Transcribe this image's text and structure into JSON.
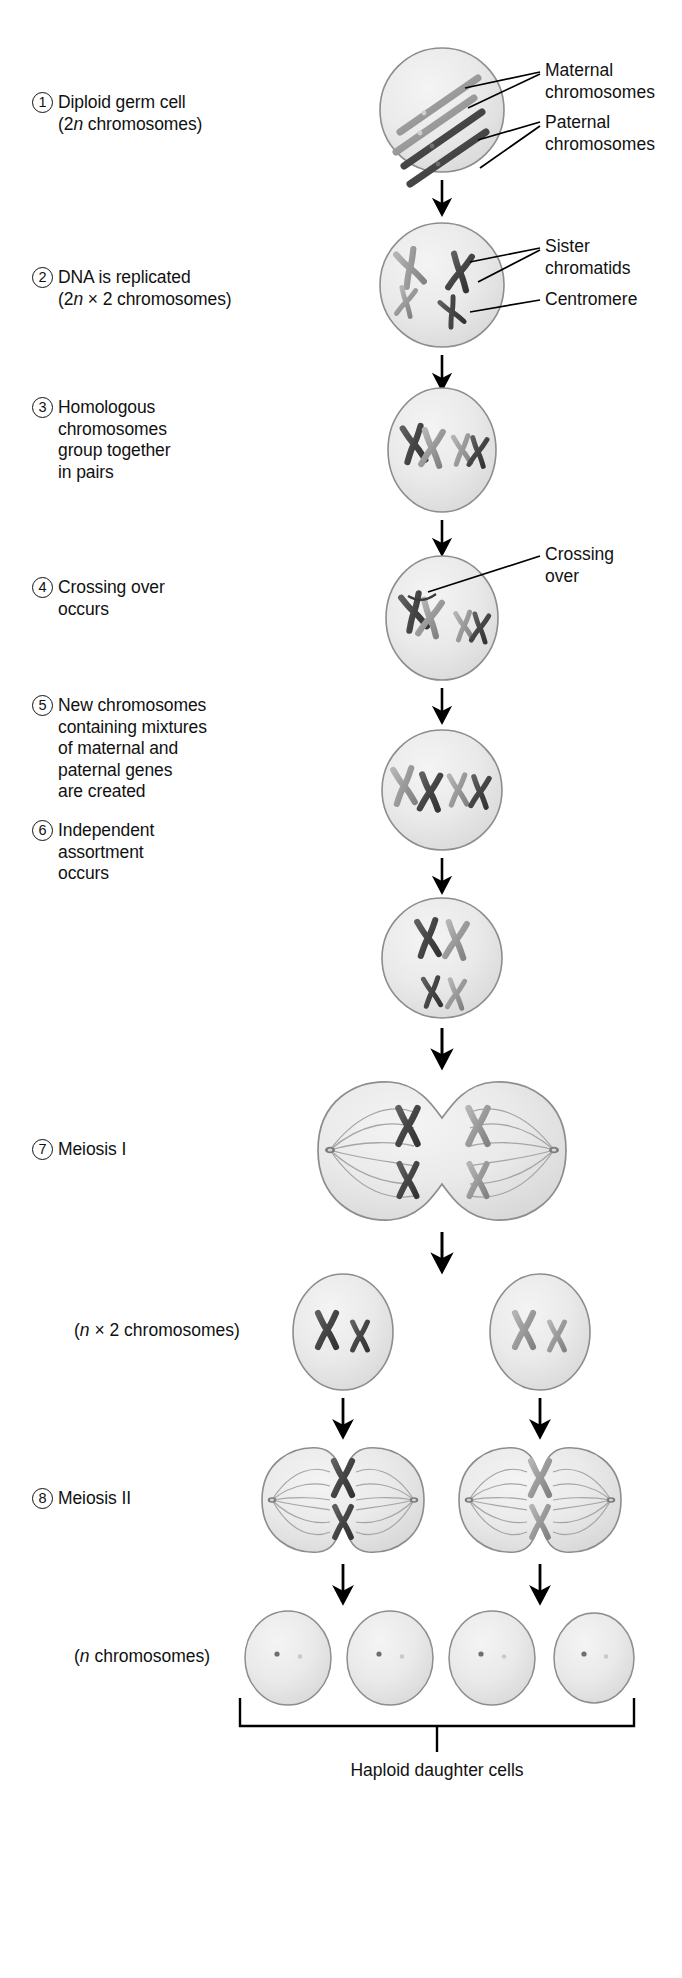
{
  "diagram": {
    "title": "Meiosis",
    "colors": {
      "background": "#ffffff",
      "text": "#111111",
      "cell_fill": "#e8e8e8",
      "cell_edge": "#8d8d8d",
      "maternal_chromosome": "#9a9a9a",
      "paternal_chromosome": "#4a4a4a",
      "arrow": "#000000",
      "leader_line": "#000000"
    }
  },
  "steps": [
    {
      "number": "1",
      "lines": [
        "Diploid germ cell",
        "(2n chromosomes)"
      ],
      "line1": "Diploid germ cell",
      "line2_pre": "(2",
      "line2_ital": "n",
      "line2_post": " chromosomes)"
    },
    {
      "number": "2",
      "lines": [
        "DNA is replicated",
        "(2n × 2 chromosomes)"
      ],
      "line1": "DNA is replicated",
      "line2_pre": "(2",
      "line2_ital": "n",
      "line2_post": " × 2 chromosomes)"
    },
    {
      "number": "3",
      "lines": [
        "Homologous",
        "chromosomes",
        "group together",
        "in pairs"
      ]
    },
    {
      "number": "4",
      "lines": [
        "Crossing over",
        "occurs"
      ]
    },
    {
      "number": "5",
      "lines": [
        "New chromosomes",
        "containing mixtures",
        "of maternal and",
        "paternal genes",
        "are created"
      ]
    },
    {
      "number": "6",
      "lines": [
        "Independent",
        "assortment",
        "occurs"
      ]
    },
    {
      "number": "7",
      "lines": [
        "Meiosis I"
      ]
    },
    {
      "number": "8",
      "lines": [
        "Meiosis II"
      ]
    }
  ],
  "paren_labels": {
    "n_times_2": {
      "pre": "(",
      "ital": "n",
      "post": " × 2 chromosomes)"
    },
    "n_only": {
      "pre": "(",
      "ital": "n",
      "post": " chromosomes)"
    }
  },
  "callouts": [
    {
      "id": "maternal",
      "lines": [
        "Maternal",
        "chromosomes"
      ]
    },
    {
      "id": "paternal",
      "lines": [
        "Paternal",
        "chromosomes"
      ]
    },
    {
      "id": "sister-chromatids",
      "lines": [
        "Sister",
        "chromatids"
      ]
    },
    {
      "id": "centromere",
      "lines": [
        "Centromere"
      ]
    },
    {
      "id": "crossing-over",
      "lines": [
        "Crossing",
        "over"
      ]
    }
  ],
  "caption": {
    "haploid": "Haploid daughter cells"
  },
  "cells": [
    {
      "stage": 1,
      "label": "diploid-germ-cell",
      "chromosomes": 4,
      "form": "diagonal-rods"
    },
    {
      "stage": 2,
      "label": "replicated-cell",
      "chromosomes": 4,
      "form": "x-shaped-scattered"
    },
    {
      "stage": 3,
      "label": "homologous-paired-cell",
      "chromosomes": 4,
      "form": "x-shaped-pairs"
    },
    {
      "stage": 4,
      "label": "crossing-over-cell",
      "chromosomes": 4,
      "form": "x-shaped-crossed"
    },
    {
      "stage": 5,
      "label": "recombined-cell",
      "chromosomes": 4,
      "form": "x-shaped-row"
    },
    {
      "stage": 6,
      "label": "independent-assortment-cell",
      "chromosomes": 4,
      "form": "x-shaped-two-rows"
    },
    {
      "stage": 7,
      "label": "meiosis-one-cell",
      "chromosomes": 4,
      "form": "dividing-dumbbell"
    },
    {
      "stage": "n2-left",
      "label": "daughter-cell-left",
      "chromosomes": 2,
      "form": "x-shaped-pair"
    },
    {
      "stage": "n2-right",
      "label": "daughter-cell-right",
      "chromosomes": 2,
      "form": "x-shaped-pair"
    },
    {
      "stage": "8-left",
      "label": "meiosis-two-cell-left",
      "chromosomes": 2,
      "form": "dividing-dumbbell"
    },
    {
      "stage": "8-right",
      "label": "meiosis-two-cell-right",
      "chromosomes": 2,
      "form": "dividing-dumbbell"
    },
    {
      "stage": "h1",
      "label": "haploid-cell-1",
      "chromosomes": 2,
      "form": "vertical-rods"
    },
    {
      "stage": "h2",
      "label": "haploid-cell-2",
      "chromosomes": 2,
      "form": "vertical-rods"
    },
    {
      "stage": "h3",
      "label": "haploid-cell-3",
      "chromosomes": 2,
      "form": "vertical-rods"
    },
    {
      "stage": "h4",
      "label": "haploid-cell-4",
      "chromosomes": 2,
      "form": "vertical-rods"
    }
  ]
}
